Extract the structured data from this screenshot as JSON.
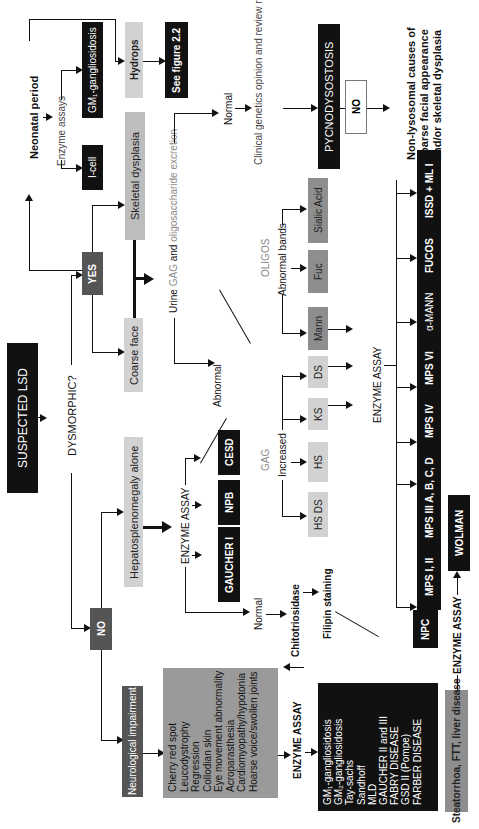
{
  "diagram": {
    "orientation": "rotated 90 degrees counter-clockwise",
    "colors": {
      "black_box": "#111111",
      "dark_box": "#555555",
      "mid_box": "#8e8e8e",
      "light_box": "#d2d2d2",
      "gray_text": "#8a8a8a"
    },
    "root": "SUSPECTED LSD",
    "question": "DYSMORPHIC?",
    "yes": "YES",
    "no": "NO",
    "neonatal": {
      "label": "Neonatal period",
      "enzyme_assays": "Enzyme assays",
      "icell": "I-cell",
      "gm1": "GM₁-gangliosidosis",
      "hydrops": "Hydrops",
      "see_figure": "See figure 2.2"
    },
    "dysmorphic": {
      "skeletal": "Skeletal dysplasia",
      "coarse_face": "Coarse face",
      "urine_prefix": "Urine ",
      "urine_gag": "GAG",
      "urine_and": " and ",
      "urine_oligo": "oligosaccharide excretion",
      "normal": "Normal",
      "clinical": "Clinical genetics opinion and review radiology",
      "pycno": "PYCNODYSOSTOSIS",
      "no_box": "NO",
      "non_lysosomal": "Non-lysosomal causes of coarse facial appearance and/or skeletal dysplasia",
      "abnormal": "Abnormal",
      "oligos": "OLIGOS",
      "abnormal_bands": "Abnormal bands",
      "gag": "GAG",
      "increased": "Increased",
      "gag_boxes": [
        "HS DS",
        "HS",
        "KS",
        "DS"
      ],
      "oligo_boxes": [
        "Mann",
        "Fuc",
        "Sialic Acid"
      ],
      "enzyme_assay": "ENZYME ASSAY",
      "results_bar": [
        "MPS I, II",
        "MPS III A, B, C, D",
        "MPS IV",
        "MPS VI",
        "α-MANN",
        "FUCOS",
        "ISSD + ML I"
      ]
    },
    "hepato": {
      "label": "Hepatosplenomegaly alone",
      "enzyme_assay": "ENZYME ASSAY",
      "results": [
        "GAUCHER I",
        "NPB",
        "CESD"
      ],
      "normal": "Normal",
      "chitotriosidase": "Chitotriosidase",
      "filipin": "Filipin staining",
      "npc": "NPC"
    },
    "neuro": {
      "label": "Neurological impairment",
      "symptoms": [
        "Cherry red spot",
        "Leucodystrophy",
        "Regression",
        "Collodian skin",
        "Eye movement abnormality",
        "Acroparasthesia",
        "Cardiomyopathy/hypotonia",
        "Hoarse voice/swollen joints"
      ],
      "enzyme_assay": "ENZYME ASSAY",
      "diseases": [
        "GM₁-gangliosidosis",
        "GM₂-gangliosidosis",
        "      Tay-sachs",
        "      Sandhoff",
        "MLD",
        "GAUCHER II and III",
        "FABRY DISEASE",
        "GSD II (Pompe)",
        "FARBER DISEASE"
      ]
    },
    "steatorrhoa": {
      "label": "Steatorrhoa, FTT, liver disease",
      "enzyme_assay": "ENZYME ASSAY",
      "result": "WOLMAN"
    }
  }
}
